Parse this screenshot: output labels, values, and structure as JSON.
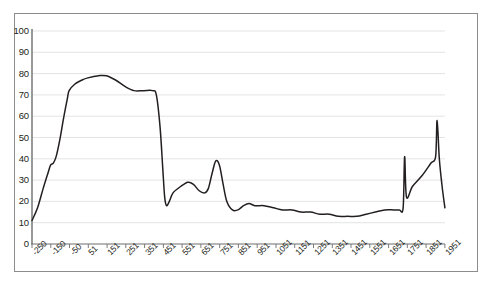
{
  "chart_data": {
    "type": "line",
    "title": "",
    "xlabel": "",
    "ylabel": "",
    "ylim": [
      0,
      100
    ],
    "ytick_values": [
      0,
      10,
      20,
      30,
      40,
      50,
      60,
      70,
      80,
      90,
      100
    ],
    "ytick_labels": [
      "0",
      "10",
      "20",
      "30",
      "40",
      "50",
      "60",
      "70",
      "80",
      "90",
      "100"
    ],
    "categories": [
      "-250",
      "-150",
      "-50",
      "51",
      "151",
      "251",
      "351",
      "451",
      "551",
      "651",
      "751",
      "851",
      "951",
      "1051",
      "1151",
      "1251",
      "1351",
      "1451",
      "1551",
      "1651",
      "1751",
      "1851",
      "1951"
    ],
    "grid": "horizontal",
    "legend": "none",
    "line_color": "#231f20",
    "series": [
      {
        "name": "series-1",
        "values": [
          11,
          37,
          75,
          79,
          76,
          73,
          72,
          19,
          27,
          29,
          25,
          39,
          16,
          18,
          16,
          15,
          14,
          13,
          14,
          15,
          41,
          23,
          58
        ],
        "points": [
          {
            "x": -250,
            "y": 11
          },
          {
            "x": -220,
            "y": 17
          },
          {
            "x": -190,
            "y": 26
          },
          {
            "x": -165,
            "y": 33
          },
          {
            "x": -150,
            "y": 37
          },
          {
            "x": -135,
            "y": 38
          },
          {
            "x": -120,
            "y": 41
          },
          {
            "x": -100,
            "y": 49
          },
          {
            "x": -80,
            "y": 59
          },
          {
            "x": -60,
            "y": 68
          },
          {
            "x": -50,
            "y": 72
          },
          {
            "x": -20,
            "y": 75
          },
          {
            "x": 20,
            "y": 77
          },
          {
            "x": 51,
            "y": 78
          },
          {
            "x": 110,
            "y": 79
          },
          {
            "x": 151,
            "y": 79
          },
          {
            "x": 200,
            "y": 77
          },
          {
            "x": 251,
            "y": 74
          },
          {
            "x": 300,
            "y": 72
          },
          {
            "x": 351,
            "y": 72
          },
          {
            "x": 400,
            "y": 72
          },
          {
            "x": 420,
            "y": 70
          },
          {
            "x": 440,
            "y": 55
          },
          {
            "x": 455,
            "y": 35
          },
          {
            "x": 465,
            "y": 22
          },
          {
            "x": 475,
            "y": 18
          },
          {
            "x": 490,
            "y": 20
          },
          {
            "x": 510,
            "y": 24
          },
          {
            "x": 551,
            "y": 27
          },
          {
            "x": 590,
            "y": 29
          },
          {
            "x": 620,
            "y": 28
          },
          {
            "x": 651,
            "y": 25
          },
          {
            "x": 680,
            "y": 24
          },
          {
            "x": 700,
            "y": 26
          },
          {
            "x": 720,
            "y": 33
          },
          {
            "x": 740,
            "y": 39
          },
          {
            "x": 760,
            "y": 37
          },
          {
            "x": 780,
            "y": 28
          },
          {
            "x": 800,
            "y": 20
          },
          {
            "x": 830,
            "y": 16
          },
          {
            "x": 860,
            "y": 16
          },
          {
            "x": 890,
            "y": 18
          },
          {
            "x": 920,
            "y": 19
          },
          {
            "x": 951,
            "y": 18
          },
          {
            "x": 1000,
            "y": 18
          },
          {
            "x": 1051,
            "y": 17
          },
          {
            "x": 1100,
            "y": 16
          },
          {
            "x": 1151,
            "y": 16
          },
          {
            "x": 1200,
            "y": 15
          },
          {
            "x": 1251,
            "y": 15
          },
          {
            "x": 1300,
            "y": 14
          },
          {
            "x": 1351,
            "y": 14
          },
          {
            "x": 1400,
            "y": 13
          },
          {
            "x": 1451,
            "y": 13
          },
          {
            "x": 1500,
            "y": 13
          },
          {
            "x": 1551,
            "y": 14
          },
          {
            "x": 1600,
            "y": 15
          },
          {
            "x": 1651,
            "y": 16
          },
          {
            "x": 1700,
            "y": 16
          },
          {
            "x": 1730,
            "y": 16
          },
          {
            "x": 1750,
            "y": 17
          },
          {
            "x": 1758,
            "y": 41
          },
          {
            "x": 1768,
            "y": 22
          },
          {
            "x": 1800,
            "y": 27
          },
          {
            "x": 1851,
            "y": 32
          },
          {
            "x": 1900,
            "y": 38
          },
          {
            "x": 1925,
            "y": 41
          },
          {
            "x": 1933,
            "y": 58
          },
          {
            "x": 1945,
            "y": 40
          },
          {
            "x": 1960,
            "y": 27
          },
          {
            "x": 1975,
            "y": 17
          }
        ]
      }
    ]
  }
}
